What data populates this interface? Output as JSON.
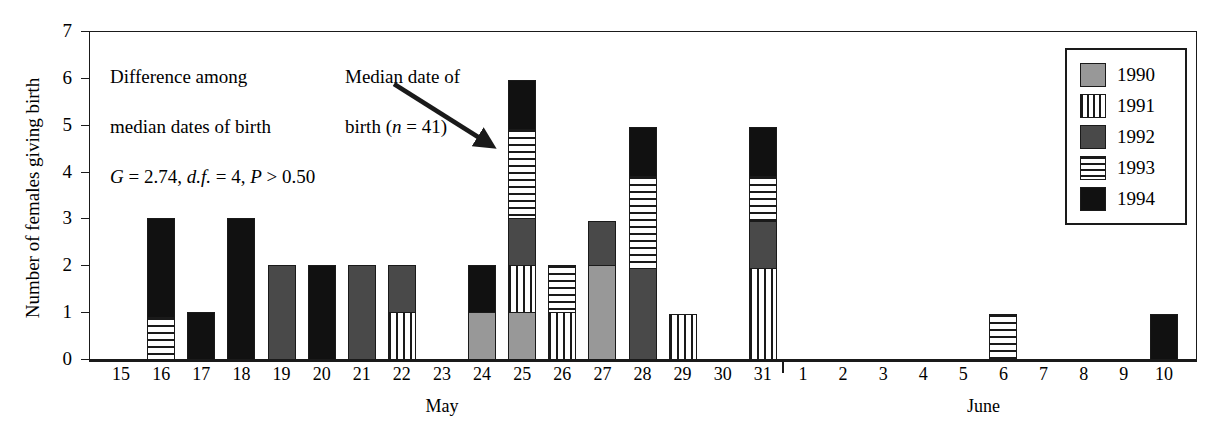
{
  "chart_data": {
    "type": "bar",
    "subtype": "stacked",
    "title": "",
    "xlabel": "",
    "ylabel": "Number of females giving birth",
    "ylim": [
      0,
      7
    ],
    "ytick_labels": [
      "0",
      "1",
      "2",
      "3",
      "4",
      "5",
      "6",
      "7"
    ],
    "grid": false,
    "legend_position": "top-right",
    "series": [
      {
        "name": "1990",
        "fill": "light-gray-solid",
        "color": "#989898"
      },
      {
        "name": "1991",
        "fill": "vertical-stripes",
        "color": "#ffffff"
      },
      {
        "name": "1992",
        "fill": "dark-gray-solid",
        "color": "#494949"
      },
      {
        "name": "1993",
        "fill": "horizontal-stripes",
        "color": "#ffffff"
      },
      {
        "name": "1994",
        "fill": "black-solid",
        "color": "#111111"
      }
    ],
    "months": [
      {
        "name": "May",
        "days": [
          15,
          16,
          17,
          18,
          19,
          20,
          21,
          22,
          23,
          24,
          25,
          26,
          27,
          28,
          29,
          30,
          31
        ]
      },
      {
        "name": "June",
        "days": [
          1,
          2,
          3,
          4,
          5,
          6,
          7,
          8,
          9,
          10
        ]
      }
    ],
    "categories": [
      "May 15",
      "May 16",
      "May 17",
      "May 18",
      "May 19",
      "May 20",
      "May 21",
      "May 22",
      "May 23",
      "May 24",
      "May 25",
      "May 26",
      "May 27",
      "May 28",
      "May 29",
      "May 30",
      "May 31",
      "June 1",
      "June 2",
      "June 3",
      "June 4",
      "June 5",
      "June 6",
      "June 7",
      "June 8",
      "June 9",
      "June 10"
    ],
    "stacks": [
      {
        "category": "May 15",
        "segments": []
      },
      {
        "category": "May 16",
        "segments": [
          {
            "year": "1993",
            "from": 0,
            "to": 0.9
          },
          {
            "year": "1994",
            "from": 0.9,
            "to": 3
          }
        ]
      },
      {
        "category": "May 17",
        "segments": [
          {
            "year": "1994",
            "from": 0,
            "to": 1
          }
        ]
      },
      {
        "category": "May 18",
        "segments": [
          {
            "year": "1994",
            "from": 0,
            "to": 3
          }
        ]
      },
      {
        "category": "May 19",
        "segments": [
          {
            "year": "1992",
            "from": 0,
            "to": 2
          }
        ]
      },
      {
        "category": "May 20",
        "segments": [
          {
            "year": "1994",
            "from": 0,
            "to": 2
          }
        ]
      },
      {
        "category": "May 21",
        "segments": [
          {
            "year": "1992",
            "from": 0,
            "to": 2
          }
        ]
      },
      {
        "category": "May 22",
        "segments": [
          {
            "year": "1991",
            "from": 0,
            "to": 1
          },
          {
            "year": "1992",
            "from": 1,
            "to": 2
          }
        ]
      },
      {
        "category": "May 23",
        "segments": []
      },
      {
        "category": "May 24",
        "segments": [
          {
            "year": "1990",
            "from": 0,
            "to": 1
          },
          {
            "year": "1994",
            "from": 1,
            "to": 2
          }
        ]
      },
      {
        "category": "May 25",
        "segments": [
          {
            "year": "1990",
            "from": 0,
            "to": 1
          },
          {
            "year": "1991",
            "from": 1,
            "to": 2
          },
          {
            "year": "1992",
            "from": 2,
            "to": 3
          },
          {
            "year": "1993",
            "from": 3,
            "to": 4.9
          },
          {
            "year": "1994",
            "from": 4.9,
            "to": 5.95
          }
        ]
      },
      {
        "category": "May 26",
        "segments": [
          {
            "year": "1991",
            "from": 0,
            "to": 1
          },
          {
            "year": "1993",
            "from": 1,
            "to": 2
          }
        ]
      },
      {
        "category": "May 27",
        "segments": [
          {
            "year": "1990",
            "from": 0,
            "to": 2
          },
          {
            "year": "1992",
            "from": 2,
            "to": 2.95
          }
        ]
      },
      {
        "category": "May 28",
        "segments": [
          {
            "year": "1992",
            "from": 0,
            "to": 1.95
          },
          {
            "year": "1993",
            "from": 1.95,
            "to": 3.9
          },
          {
            "year": "1994",
            "from": 3.9,
            "to": 4.95
          }
        ]
      },
      {
        "category": "May 29",
        "segments": [
          {
            "year": "1991",
            "from": 0,
            "to": 0.95
          }
        ]
      },
      {
        "category": "May 30",
        "segments": []
      },
      {
        "category": "May 31",
        "segments": [
          {
            "year": "1991",
            "from": 0,
            "to": 1.95
          },
          {
            "year": "1992",
            "from": 1.95,
            "to": 2.95
          },
          {
            "year": "1993",
            "from": 2.95,
            "to": 3.9
          },
          {
            "year": "1994",
            "from": 3.9,
            "to": 4.95
          }
        ]
      },
      {
        "category": "June 1",
        "segments": []
      },
      {
        "category": "June 2",
        "segments": []
      },
      {
        "category": "June 3",
        "segments": []
      },
      {
        "category": "June 4",
        "segments": []
      },
      {
        "category": "June 5",
        "segments": []
      },
      {
        "category": "June 6",
        "segments": [
          {
            "year": "1993",
            "from": 0,
            "to": 0.95
          }
        ]
      },
      {
        "category": "June 7",
        "segments": []
      },
      {
        "category": "June 8",
        "segments": []
      },
      {
        "category": "June 9",
        "segments": []
      },
      {
        "category": "June 10",
        "segments": [
          {
            "year": "1994",
            "from": 0,
            "to": 0.95
          }
        ]
      }
    ],
    "annotations": [
      {
        "id": "stats",
        "lines": [
          "Difference among",
          "median dates of birth"
        ],
        "formula_parts": [
          "G",
          " = 2.74, ",
          "d.f.",
          " = 4, ",
          "P",
          " > 0.50"
        ]
      },
      {
        "id": "median",
        "lines": [
          "Median date of",
          "birth ("
        ],
        "n_italic": "n",
        "n_value": " = 41)",
        "points_to": "May 25"
      }
    ]
  },
  "legend": {
    "items": [
      {
        "label": "1990",
        "swatch": "sw1990"
      },
      {
        "label": "1991",
        "swatch": "sw1991"
      },
      {
        "label": "1992",
        "swatch": "sw1992"
      },
      {
        "label": "1993",
        "swatch": "sw1993"
      },
      {
        "label": "1994",
        "swatch": "sw1994"
      }
    ]
  }
}
